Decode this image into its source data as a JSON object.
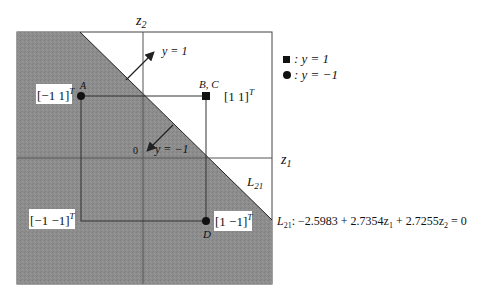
{
  "diagram": {
    "axes": {
      "z1_label": "z",
      "z1_sub": "1",
      "z2_label": "z",
      "z2_sub": "2",
      "origin_label": "0"
    },
    "points": [
      {
        "name": "A",
        "label": "A",
        "coord_text": "[−1  1]",
        "sup": "T",
        "marker": "circle",
        "class": "y=-1"
      },
      {
        "name": "BC",
        "label": "B, C",
        "coord_text": "[1  1]",
        "sup": "T",
        "marker": "square",
        "class": "y=1"
      },
      {
        "name": "D",
        "label": "D",
        "coord_text": "[1  −1]",
        "sup": "T",
        "marker": "circle",
        "class": "y=-1"
      },
      {
        "name": "corner",
        "label": "",
        "coord_text": "[−1  −1]",
        "sup": "T",
        "marker": "none",
        "class": ""
      }
    ],
    "arrows": {
      "positive_label": "y = 1",
      "negative_label": "y = −1"
    },
    "line_label": "L",
    "line_label_sub": "21",
    "equation": {
      "lhs": "L",
      "lhs_sub": "21",
      "text": ": −2.5983 + 2.7354z",
      "z1_sub": "1",
      "mid": " + 2.7255z",
      "z2_sub": "2",
      "rhs": " = 0"
    },
    "legend": [
      {
        "marker": "square",
        "text": ":  y = 1"
      },
      {
        "marker": "circle",
        "text": ":  y = −1"
      }
    ],
    "colors": {
      "shaded_region": "#8a8a8a",
      "lines": "#333333",
      "background": "#ffffff"
    }
  }
}
